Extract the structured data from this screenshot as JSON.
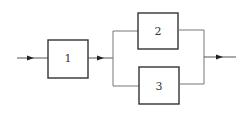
{
  "diagram": {
    "type": "block-diagram",
    "colors": {
      "line": "#555555",
      "box": "#333333",
      "background": "#ffffff"
    },
    "blocks": [
      {
        "id": "1",
        "label": "1"
      },
      {
        "id": "2",
        "label": "2"
      },
      {
        "id": "3",
        "label": "3"
      }
    ],
    "connections": [
      {
        "from": "input",
        "to": "1"
      },
      {
        "from": "1",
        "to": "split"
      },
      {
        "from": "split",
        "to": "2"
      },
      {
        "from": "split",
        "to": "3"
      },
      {
        "from": "2",
        "to": "merge"
      },
      {
        "from": "3",
        "to": "merge"
      },
      {
        "from": "merge",
        "to": "output"
      }
    ]
  }
}
